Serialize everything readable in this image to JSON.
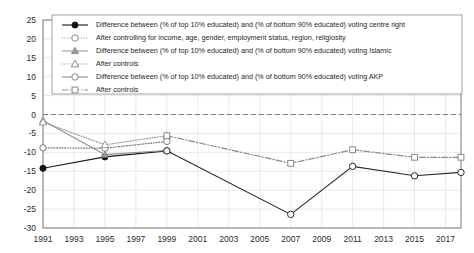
{
  "chart_data": {
    "type": "line",
    "title": "",
    "xlabel": "",
    "ylabel": "",
    "xlim": [
      1991,
      2018
    ],
    "ylim": [
      -30,
      25
    ],
    "ytick_step": 5,
    "xtick_step": 2,
    "grid": true,
    "legend_position": "top-inside",
    "xticks": [
      "1991",
      "1993",
      "1995",
      "1997",
      "1999",
      "2001",
      "2003",
      "2005",
      "2007",
      "2009",
      "2011",
      "2013",
      "2015",
      "2017"
    ],
    "yticks": [
      "25",
      "20",
      "15",
      "10",
      "5",
      "0",
      "-5",
      "-10",
      "-15",
      "-20",
      "-25",
      "-30"
    ],
    "series": [
      {
        "name": "Difference between (% of top 10% educated) and (% of bottom 90% educated) voting centre right",
        "key": "centre_right",
        "style": "solid",
        "marker": "filled-circle",
        "color": "#1a1a1a",
        "x": [
          1991,
          1995,
          1999
        ],
        "values": [
          -14.2,
          -11.2,
          -9.6
        ]
      },
      {
        "name": "After controlling for income, age, gender, employment status, region, religiosity",
        "key": "centre_right_controls",
        "style": "dotted",
        "marker": "open-circle",
        "color": "#7a7a7a",
        "x": [
          1991,
          1995,
          1999
        ],
        "values": [
          -8.8,
          -8.9,
          -7.1
        ]
      },
      {
        "name": "Difference between (% of top 10% educated) and (% of bottom 90% educated) voting Islamic",
        "key": "islamic",
        "style": "solid",
        "marker": "filled-triangle",
        "color": "#8e8e8e",
        "x": [
          1991,
          1995,
          1999
        ],
        "values": [
          -1.6,
          -10.6,
          -9.5
        ]
      },
      {
        "name": "After controls",
        "key": "islamic_controls",
        "style": "dotted",
        "marker": "open-triangle",
        "color": "#9a9a9a",
        "x": [
          1991,
          1995,
          1999
        ],
        "values": [
          -2.0,
          -8.0,
          -5.6
        ]
      },
      {
        "name": "Difference between (% of top 10% educated) and (% of bottom 90% educated) voting AKP",
        "key": "akp",
        "style": "solid",
        "marker": "open-circle",
        "color": "#2a2a2a",
        "x": [
          1999,
          2007,
          2011,
          2015,
          2018
        ],
        "values": [
          -9.6,
          -26.4,
          -13.7,
          -16.2,
          -15.3
        ]
      },
      {
        "name": "After controls",
        "key": "akp_controls",
        "style": "dash-dot",
        "marker": "open-square",
        "color": "#8a8a8a",
        "x": [
          1999,
          2007,
          2011,
          2015,
          2018
        ],
        "values": [
          -5.6,
          -12.9,
          -9.3,
          -11.3,
          -11.3
        ]
      }
    ],
    "legend_items": [
      {
        "label": "Difference between (% of top 10% educated) and (% of bottom 90% educated) voting centre right",
        "marker": "filled-circle",
        "style": "solid"
      },
      {
        "label": "After controlling for income, age, gender, employment status, region, religiosity",
        "marker": "open-circle",
        "style": "dotted"
      },
      {
        "label": "Difference between (% of top 10% educated) and (% of bottom 90% educated) voting Islamic",
        "marker": "filled-triangle",
        "style": "solid"
      },
      {
        "label": "After controls",
        "marker": "open-triangle",
        "style": "dotted"
      },
      {
        "label": "Difference between (% of top 10% educated) and (% of bottom 90% educated) voting AKP",
        "marker": "open-circle",
        "style": "solid"
      },
      {
        "label": "After controls",
        "marker": "open-square",
        "style": "dash-dot"
      }
    ],
    "colors": {
      "axis": "#7a7a7a",
      "grid": "#dcdcdc",
      "background": "#ffffff",
      "zero_line": "#6e6e6e"
    }
  }
}
